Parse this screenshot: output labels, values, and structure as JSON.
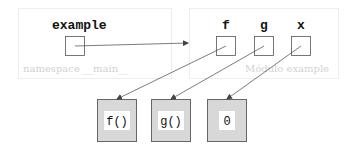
{
  "frames": {
    "main": {
      "label": "namespace __main__",
      "variables": [
        {
          "name": "example"
        }
      ]
    },
    "module": {
      "label": "Módulo example",
      "variables": [
        {
          "name": "f"
        },
        {
          "name": "g"
        },
        {
          "name": "x"
        }
      ]
    }
  },
  "objects": [
    {
      "label": "f()"
    },
    {
      "label": "g()"
    },
    {
      "label": "0"
    }
  ],
  "colors": {
    "frame_border": "#eeeeee",
    "frame_label": "#d2d2d2",
    "object_fill": "#d8d8d8",
    "arrow": "#444444"
  }
}
